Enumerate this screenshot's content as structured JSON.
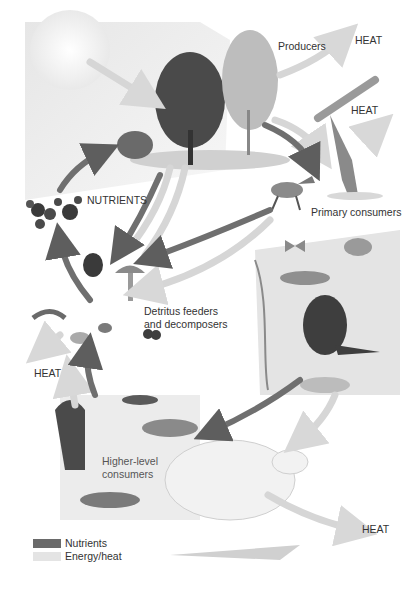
{
  "diagram": {
    "title_labels": {
      "producers": "Producers",
      "primary_consumers": "Primary consumers",
      "detritus_line1": "Detritus feeders",
      "detritus_line2": "and decomposers",
      "higher_line1": "Higher-level",
      "higher_line2": "consumers",
      "nutrients": "NUTRIENTS"
    },
    "heat_labels": [
      "HEAT",
      "HEAT",
      "HEAT",
      "HEAT"
    ],
    "legend": [
      {
        "label": "Nutrients",
        "color": "#6a6a6a"
      },
      {
        "label": "Energy/heat",
        "color": "#e4e4e4"
      }
    ],
    "colors": {
      "nutrient_arrow": "#6f6f6f",
      "energy_arrow": "#d6d6d6",
      "sky": "#ececec",
      "ground": "#d9d9d9"
    }
  }
}
